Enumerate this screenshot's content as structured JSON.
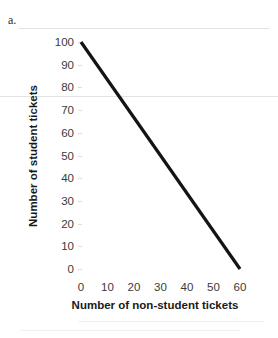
{
  "figure": {
    "label": "a."
  },
  "chart_data": {
    "type": "line",
    "title": "",
    "xlabel": "Number of non-student tickets",
    "ylabel": "Number of student tickets",
    "xlim": [
      0,
      60
    ],
    "ylim": [
      0,
      100
    ],
    "xticks": [
      0,
      10,
      20,
      30,
      40,
      50,
      60
    ],
    "yticks": [
      0,
      10,
      20,
      30,
      40,
      50,
      60,
      70,
      80,
      90,
      100
    ],
    "grid": false,
    "legend": null,
    "series": [
      {
        "name": "budget-constraint",
        "color": "#141414",
        "x": [
          0,
          60
        ],
        "y": [
          100,
          0
        ],
        "points": [
          {
            "x": 0,
            "y": 100
          },
          {
            "x": 10,
            "y": 83.33
          },
          {
            "x": 20,
            "y": 66.67
          },
          {
            "x": 30,
            "y": 50
          },
          {
            "x": 40,
            "y": 33.33
          },
          {
            "x": 50,
            "y": 16.67
          },
          {
            "x": 60,
            "y": 0
          }
        ]
      }
    ]
  },
  "style": {
    "line_color": "#141414",
    "tick_color": "#3a3a3a",
    "title_color": "#1a1a1a",
    "artifact_color": "#e3e3e6"
  }
}
